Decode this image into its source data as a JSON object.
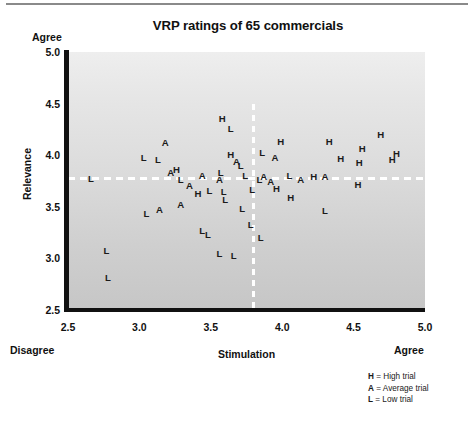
{
  "chart_data": {
    "type": "scatter",
    "title": "VRP ratings of 65 commercials",
    "xlabel": "Stimulation",
    "ylabel": "Relevance",
    "xlim": [
      2.5,
      5.0
    ],
    "ylim": [
      2.5,
      5.0
    ],
    "xticks": [
      "2.5",
      "3.0",
      "3.5",
      "4.0",
      "4.5",
      "5.0"
    ],
    "yticks": [
      "5.0",
      "4.5",
      "4.0",
      "3.5",
      "3.0",
      "2.5"
    ],
    "grid": false,
    "legend_position": "below-right",
    "anchors": {
      "y_top": "Agree",
      "x_left": "Disagree",
      "x_right": "Agree"
    },
    "reference_lines": {
      "vertical_x": 3.8,
      "horizontal_y": 3.77,
      "style": "dashed",
      "color": "#ffffff"
    },
    "legend": [
      {
        "key": "H",
        "sep": " = ",
        "label": "High trial"
      },
      {
        "key": "A",
        "sep": " = ",
        "label": "Average trial"
      },
      {
        "key": "L",
        "sep": " = ",
        "label": "Low trial"
      }
    ],
    "series": [
      {
        "name": "High trial",
        "marker": "H"
      },
      {
        "name": "Average trial",
        "marker": "A"
      },
      {
        "name": "Low trial",
        "marker": "L"
      }
    ],
    "points": [
      {
        "m": "H",
        "x": 3.58,
        "y": 4.35
      },
      {
        "m": "L",
        "x": 3.64,
        "y": 4.25
      },
      {
        "m": "A",
        "x": 3.18,
        "y": 4.12
      },
      {
        "m": "H",
        "x": 3.99,
        "y": 4.13
      },
      {
        "m": "H",
        "x": 4.33,
        "y": 4.13
      },
      {
        "m": "H",
        "x": 4.69,
        "y": 4.2
      },
      {
        "m": "H",
        "x": 4.56,
        "y": 4.06
      },
      {
        "m": "H",
        "x": 3.64,
        "y": 4.0
      },
      {
        "m": "A",
        "x": 3.68,
        "y": 3.93
      },
      {
        "m": "L",
        "x": 3.71,
        "y": 3.9
      },
      {
        "m": "L",
        "x": 3.03,
        "y": 3.97
      },
      {
        "m": "L",
        "x": 3.13,
        "y": 3.95
      },
      {
        "m": "L",
        "x": 3.86,
        "y": 4.02
      },
      {
        "m": "A",
        "x": 3.95,
        "y": 3.97
      },
      {
        "m": "H",
        "x": 4.41,
        "y": 3.96
      },
      {
        "m": "H",
        "x": 4.54,
        "y": 3.92
      },
      {
        "m": "H",
        "x": 4.77,
        "y": 3.95
      },
      {
        "m": "H",
        "x": 4.8,
        "y": 4.01
      },
      {
        "m": "A",
        "x": 3.22,
        "y": 3.83
      },
      {
        "m": "H",
        "x": 3.26,
        "y": 3.86
      },
      {
        "m": "L",
        "x": 3.29,
        "y": 3.76
      },
      {
        "m": "A",
        "x": 3.44,
        "y": 3.8
      },
      {
        "m": "L",
        "x": 3.57,
        "y": 3.83
      },
      {
        "m": "A",
        "x": 3.56,
        "y": 3.76
      },
      {
        "m": "L",
        "x": 3.74,
        "y": 3.8
      },
      {
        "m": "L",
        "x": 2.66,
        "y": 3.77
      },
      {
        "m": "A",
        "x": 3.87,
        "y": 3.79
      },
      {
        "m": "L",
        "x": 3.84,
        "y": 3.76
      },
      {
        "m": "A",
        "x": 3.92,
        "y": 3.74
      },
      {
        "m": "L",
        "x": 4.05,
        "y": 3.8
      },
      {
        "m": "A",
        "x": 4.13,
        "y": 3.76
      },
      {
        "m": "H",
        "x": 4.22,
        "y": 3.79
      },
      {
        "m": "A",
        "x": 4.3,
        "y": 3.79
      },
      {
        "m": "H",
        "x": 4.53,
        "y": 3.71
      },
      {
        "m": "A",
        "x": 3.35,
        "y": 3.7
      },
      {
        "m": "H",
        "x": 3.41,
        "y": 3.62
      },
      {
        "m": "H",
        "x": 3.96,
        "y": 3.67
      },
      {
        "m": "H",
        "x": 4.06,
        "y": 3.59
      },
      {
        "m": "L",
        "x": 3.49,
        "y": 3.65
      },
      {
        "m": "L",
        "x": 3.59,
        "y": 3.64
      },
      {
        "m": "L",
        "x": 3.6,
        "y": 3.57
      },
      {
        "m": "L",
        "x": 3.79,
        "y": 3.66
      },
      {
        "m": "A",
        "x": 3.29,
        "y": 3.52
      },
      {
        "m": "A",
        "x": 3.14,
        "y": 3.47
      },
      {
        "m": "L",
        "x": 3.05,
        "y": 3.43
      },
      {
        "m": "L",
        "x": 3.72,
        "y": 3.48
      },
      {
        "m": "L",
        "x": 4.3,
        "y": 3.46
      },
      {
        "m": "L",
        "x": 3.78,
        "y": 3.32
      },
      {
        "m": "L",
        "x": 3.44,
        "y": 3.27
      },
      {
        "m": "L",
        "x": 3.48,
        "y": 3.23
      },
      {
        "m": "L",
        "x": 3.85,
        "y": 3.2
      },
      {
        "m": "L",
        "x": 2.77,
        "y": 3.07
      },
      {
        "m": "L",
        "x": 3.56,
        "y": 3.04
      },
      {
        "m": "L",
        "x": 3.66,
        "y": 3.02
      },
      {
        "m": "L",
        "x": 2.78,
        "y": 2.81
      }
    ]
  }
}
